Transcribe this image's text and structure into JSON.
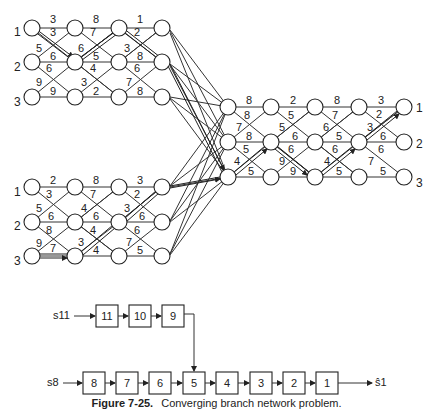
{
  "caption": {
    "figure": "Figure 7-25.",
    "title": "Converging branch network problem."
  },
  "networks": {
    "top_left": {
      "row_labels": [
        "1",
        "2",
        "3"
      ],
      "horizontal_costs": [
        [
          "3",
          "8",
          "1"
        ],
        [
          "6",
          "5",
          "8"
        ],
        [
          "9",
          "2",
          "8"
        ]
      ],
      "diagonal_costs": {
        "down": [
          [
            "3",
            "7",
            "2"
          ],
          [
            "6",
            "4",
            "6"
          ]
        ],
        "up": [
          [
            "5",
            "6",
            "3"
          ],
          [
            "9",
            "3",
            "7"
          ]
        ]
      }
    },
    "bottom_left": {
      "row_labels": [
        "1",
        "2",
        "3"
      ],
      "horizontal_costs": [
        [
          "2",
          "8",
          "3"
        ],
        [
          "6",
          "6",
          "6"
        ],
        [
          "7",
          "4",
          "5"
        ]
      ],
      "diagonal_costs": {
        "down": [
          [
            "3",
            "7",
            "2"
          ],
          [
            "8",
            "4",
            "6"
          ]
        ],
        "up": [
          [
            "5",
            "4",
            "3"
          ],
          [
            "9",
            "3",
            "7"
          ]
        ]
      }
    },
    "right": {
      "row_labels": [
        "1",
        "2",
        "3"
      ],
      "horizontal_costs": [
        [
          "8",
          "2",
          "8",
          "3"
        ],
        [
          "8",
          "6",
          "5",
          "6"
        ],
        [
          "5",
          "9",
          "5",
          "5"
        ]
      ],
      "diagonal_costs": {
        "down": [
          [
            "8",
            "5",
            "7",
            "2"
          ],
          [
            "5",
            "6",
            "6",
            "6"
          ]
        ],
        "up": [
          [
            "7",
            "5",
            "6",
            "3"
          ],
          [
            "4",
            "9",
            "4",
            "7"
          ]
        ]
      }
    }
  },
  "block_diagram": {
    "branch_input": "s11",
    "branch_stages": [
      "11",
      "10",
      "9"
    ],
    "main_input": "s8",
    "main_stages": [
      "8",
      "7",
      "6",
      "5",
      "4",
      "3",
      "2",
      "1"
    ],
    "output": "ŝ1",
    "junction_stage": "5"
  }
}
